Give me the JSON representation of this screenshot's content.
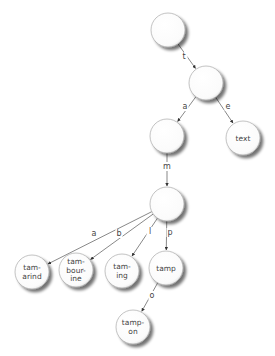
{
  "diagram": {
    "type": "trie",
    "node_radius": 17,
    "colors": {
      "node_fill": "#ffffff",
      "node_stroke": "#9a9a9a",
      "edge": "#555555",
      "text": "#444444"
    },
    "nodes": [
      {
        "id": "root",
        "x": 168,
        "y": 30,
        "lines": []
      },
      {
        "id": "t",
        "x": 206,
        "y": 83,
        "lines": []
      },
      {
        "id": "ta",
        "x": 167,
        "y": 136,
        "lines": []
      },
      {
        "id": "te",
        "x": 243,
        "y": 138,
        "lines": [
          "text"
        ]
      },
      {
        "id": "tam",
        "x": 167,
        "y": 204,
        "lines": []
      },
      {
        "id": "tamarind",
        "x": 32,
        "y": 272,
        "lines": [
          "tam-",
          "arind"
        ]
      },
      {
        "id": "tambourine",
        "x": 76,
        "y": 270,
        "lines": [
          "tam-",
          "bour-",
          "ine"
        ]
      },
      {
        "id": "taming",
        "x": 122,
        "y": 271,
        "lines": [
          "tam-",
          "ing"
        ]
      },
      {
        "id": "tamp",
        "x": 166,
        "y": 268,
        "lines": [
          "tamp"
        ]
      },
      {
        "id": "tampon",
        "x": 133,
        "y": 327,
        "lines": [
          "tamp-",
          "on"
        ]
      }
    ],
    "edges": [
      {
        "from": "root",
        "to": "t",
        "label": "t",
        "lx": 184,
        "ly": 59
      },
      {
        "from": "t",
        "to": "ta",
        "label": "a",
        "lx": 185,
        "ly": 109
      },
      {
        "from": "t",
        "to": "te",
        "label": "e",
        "lx": 228,
        "ly": 109
      },
      {
        "from": "ta",
        "to": "tam",
        "label": "m",
        "lx": 167,
        "ly": 169
      },
      {
        "from": "tam",
        "to": "tamarind",
        "label": "a",
        "lx": 94,
        "ly": 236
      },
      {
        "from": "tam",
        "to": "tambourine",
        "label": "b",
        "lx": 119,
        "ly": 236
      },
      {
        "from": "tam",
        "to": "taming",
        "label": "l",
        "lx": 150,
        "ly": 234
      },
      {
        "from": "tam",
        "to": "tamp",
        "label": "p",
        "lx": 170,
        "ly": 235
      },
      {
        "from": "tamp",
        "to": "tampon",
        "label": "o",
        "lx": 152,
        "ly": 298
      }
    ]
  }
}
